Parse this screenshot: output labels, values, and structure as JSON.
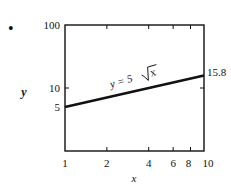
{
  "bullet": "•",
  "chart_data": {
    "type": "line",
    "title": "",
    "scale": "log-log",
    "xlabel": "x",
    "ylabel": "y",
    "xlim": [
      1,
      10
    ],
    "ylim": [
      1,
      100
    ],
    "x_ticks": [
      1,
      2,
      4,
      6,
      8,
      10
    ],
    "x_tick_labels": [
      "1",
      "2",
      "4",
      "6",
      "8",
      "10"
    ],
    "y_tick_labels": [
      "100",
      "10",
      "5"
    ],
    "y_ticks": [
      100,
      10,
      5
    ],
    "series": [
      {
        "name": "y = 5√x",
        "x": [
          1,
          10
        ],
        "values": [
          5,
          15.8
        ]
      }
    ],
    "annotations": [
      {
        "text": "y = 5√x",
        "position": "along line"
      },
      {
        "text": "15.8",
        "position": "right of frame at x=10"
      }
    ],
    "grid": false,
    "legend": "none"
  },
  "labels": {
    "equation_prefix": "y = 5",
    "equation_radicand": "x",
    "end_value": "15.8",
    "start_value": "5"
  }
}
